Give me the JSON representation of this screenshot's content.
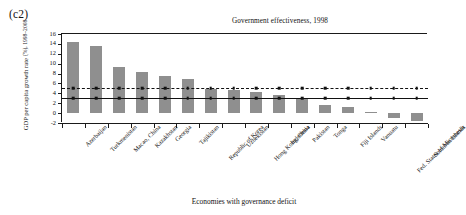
{
  "panel": {
    "label": "(c2)"
  },
  "axis": {
    "y_title_line1": "GDP per capita growth rate",
    "y_title_line2": "(%), 1998–2008",
    "x_caption": "Economies with governance deficit",
    "y_ticks": [
      "16",
      "14",
      "12",
      "10",
      "8",
      "6",
      "4",
      "2",
      "0",
      "-2"
    ]
  },
  "chart_data": {
    "type": "bar",
    "title": "Government effectiveness, 1998",
    "xlabel": "Economies with governance deficit",
    "ylabel": "GDP per capita growth rate (%), 1998–2008",
    "ylim": [
      -2,
      16
    ],
    "ytick_values": [
      16,
      14,
      12,
      10,
      8,
      6,
      4,
      2,
      0,
      -2
    ],
    "grid": false,
    "legend": "none",
    "bar_color": "#8f8f8f",
    "categories": [
      "Azerbaijan",
      "Turkmenistan",
      "Macao, China",
      "Kazakhstan",
      "Georgia",
      "Tajikistan",
      "Republic of Korea",
      "Uzbekistan",
      "Hong Kong, China",
      "Indonesia",
      "Pakistan",
      "Tonga",
      "Fiji Islands",
      "Vanuatu",
      "Fed. States of Micronesia",
      "Solomon Islands"
    ],
    "values": [
      14.3,
      13.5,
      9.4,
      8.3,
      7.6,
      6.8,
      4.9,
      4.7,
      4.3,
      3.6,
      3.1,
      1.6,
      1.3,
      0.2,
      -0.9,
      -1.5
    ],
    "reference_lines": [
      {
        "name": "upper-dashed-reference",
        "style": "dashed",
        "value": 5.0,
        "marker": "square"
      },
      {
        "name": "lower-solid-reference",
        "style": "solid",
        "value": 3.0,
        "marker": "square"
      }
    ]
  }
}
